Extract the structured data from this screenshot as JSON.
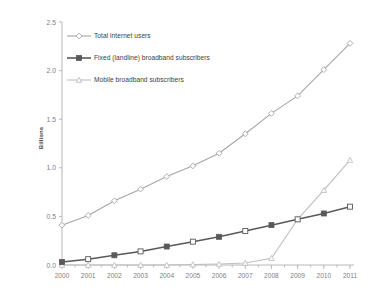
{
  "chart_data": {
    "type": "line",
    "title": "",
    "subtitle": "",
    "xlabel": "",
    "ylabel": "Billions",
    "categories": [
      "2000",
      "2001",
      "2002",
      "2003",
      "2004",
      "2005",
      "2006",
      "2007",
      "2008",
      "2009",
      "2010",
      "2011"
    ],
    "x": [
      2000,
      2001,
      2002,
      2003,
      2004,
      2005,
      2006,
      2007,
      2008,
      2009,
      2010,
      2011
    ],
    "ylim": [
      0.0,
      2.5
    ],
    "ytick_labels": [
      "0.0",
      "0.5",
      "1.0",
      "1.5",
      "2.0",
      "2.5"
    ],
    "ytick_values": [
      0.0,
      0.5,
      1.0,
      1.5,
      2.0,
      2.5
    ],
    "grid": false,
    "legend_position": "inside-upper-left",
    "series": [
      {
        "name": "Total internet users",
        "marker": "diamond-open",
        "color": "#a6a6a6",
        "values": [
          0.41,
          0.51,
          0.66,
          0.78,
          0.91,
          1.02,
          1.15,
          1.35,
          1.56,
          1.74,
          2.01,
          2.28
        ]
      },
      {
        "name": "Fixed (landline) broadband subscribers",
        "marker": "square-filled",
        "color": "#595959",
        "values": [
          0.03,
          0.06,
          0.1,
          0.14,
          0.19,
          0.24,
          0.29,
          0.35,
          0.41,
          0.47,
          0.53,
          0.6
        ]
      },
      {
        "name": "Mobile broadband subscribers",
        "marker": "triangle",
        "color": "#bfbfbf",
        "values": [
          0.0,
          0.0,
          0.0,
          0.0,
          0.0,
          0.005,
          0.01,
          0.02,
          0.07,
          0.47,
          0.77,
          1.08
        ]
      }
    ]
  },
  "axes": {
    "y_title": "Billions"
  },
  "legend": {
    "items": [
      {
        "label": "Total internet users"
      },
      {
        "label": "Fixed (landline) broadband subscribers"
      },
      {
        "label": "Mobile broadband subscribers"
      }
    ]
  },
  "colors": {
    "internet_users": "#a6a6a6",
    "fixed_broadband": "#595959",
    "mobile_broadband": "#bfbfbf",
    "axis": "#a6a6a6",
    "tick_text": "#7f7f7f",
    "label_text": "#404040"
  }
}
